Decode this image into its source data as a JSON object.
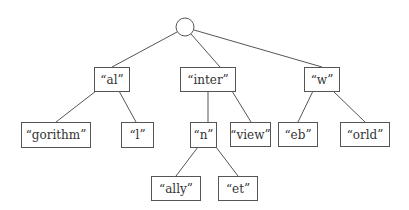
{
  "diagram": {
    "type": "trie",
    "root": {
      "cx": 185,
      "cy": 27,
      "r": 9
    },
    "nodes": [
      {
        "id": "al",
        "label": "“al”",
        "x": 94,
        "y": 67,
        "w": 35,
        "h": 24,
        "parent": "root"
      },
      {
        "id": "inter",
        "label": "“inter”",
        "x": 180,
        "y": 67,
        "w": 55,
        "h": 24,
        "parent": "root"
      },
      {
        "id": "w",
        "label": "“w”",
        "x": 304,
        "y": 67,
        "w": 35,
        "h": 24,
        "parent": "root"
      },
      {
        "id": "gorithm",
        "label": "“gorithm”",
        "x": 21,
        "y": 122,
        "w": 69,
        "h": 25,
        "parent": "al"
      },
      {
        "id": "l",
        "label": "“l”",
        "x": 121,
        "y": 122,
        "w": 32,
        "h": 25,
        "parent": "al"
      },
      {
        "id": "n",
        "label": "“n”",
        "x": 190,
        "y": 122,
        "w": 26,
        "h": 25,
        "parent": "inter"
      },
      {
        "id": "view",
        "label": "“view”",
        "x": 230,
        "y": 122,
        "w": 40,
        "h": 24,
        "parent": "inter"
      },
      {
        "id": "eb",
        "label": "“eb”",
        "x": 278,
        "y": 122,
        "w": 39,
        "h": 24,
        "parent": "w"
      },
      {
        "id": "orld",
        "label": "“orld”",
        "x": 340,
        "y": 122,
        "w": 49,
        "h": 24,
        "parent": "w"
      },
      {
        "id": "ally",
        "label": "“ally”",
        "x": 151,
        "y": 176,
        "w": 49,
        "h": 24,
        "parent": "n"
      },
      {
        "id": "et",
        "label": "“et”",
        "x": 218,
        "y": 176,
        "w": 39,
        "h": 24,
        "parent": "n"
      }
    ],
    "edges": [
      {
        "from": "root",
        "to": "al",
        "x1": 177,
        "y1": 32,
        "x2": 112,
        "y2": 67
      },
      {
        "from": "root",
        "to": "inter",
        "x1": 191,
        "y1": 34,
        "x2": 220,
        "y2": 67
      },
      {
        "from": "root",
        "to": "w",
        "x1": 194,
        "y1": 30,
        "x2": 322,
        "y2": 67
      },
      {
        "from": "al",
        "to": "gorithm",
        "x1": 96,
        "y1": 91,
        "x2": 56,
        "y2": 122
      },
      {
        "from": "al",
        "to": "l",
        "x1": 119,
        "y1": 91,
        "x2": 136,
        "y2": 122
      },
      {
        "from": "inter",
        "to": "n",
        "x1": 208,
        "y1": 91,
        "x2": 208,
        "y2": 122
      },
      {
        "from": "inter",
        "to": "view",
        "x1": 232,
        "y1": 91,
        "x2": 251,
        "y2": 122
      },
      {
        "from": "w",
        "to": "eb",
        "x1": 313,
        "y1": 91,
        "x2": 298,
        "y2": 122
      },
      {
        "from": "w",
        "to": "orld",
        "x1": 333,
        "y1": 91,
        "x2": 365,
        "y2": 122
      },
      {
        "from": "n",
        "to": "ally",
        "x1": 198,
        "y1": 147,
        "x2": 176,
        "y2": 176
      },
      {
        "from": "n",
        "to": "et",
        "x1": 216,
        "y1": 147,
        "x2": 238,
        "y2": 176
      }
    ]
  }
}
